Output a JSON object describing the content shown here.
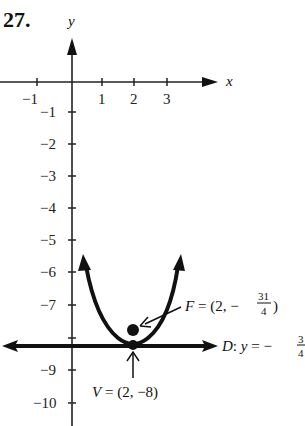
{
  "problem_number": "27.",
  "axes": {
    "x_label": "x",
    "y_label": "y",
    "x_ticks": [
      {
        "value": -1,
        "label": "−1"
      },
      {
        "value": 1,
        "label": "1"
      },
      {
        "value": 2,
        "label": "2"
      },
      {
        "value": 3,
        "label": "3"
      }
    ],
    "y_ticks": [
      {
        "value": -1,
        "label": "−1"
      },
      {
        "value": -2,
        "label": "−2"
      },
      {
        "value": -3,
        "label": "−3"
      },
      {
        "value": -4,
        "label": "−4"
      },
      {
        "value": -5,
        "label": "−5"
      },
      {
        "value": -6,
        "label": "−6"
      },
      {
        "value": -7,
        "label": "−7"
      },
      {
        "value": -9,
        "label": "−9"
      },
      {
        "value": -10,
        "label": "−10"
      }
    ]
  },
  "parabola": {
    "vertex": [
      2,
      -8
    ],
    "focus": [
      2,
      -7.75
    ],
    "directrix_y": -8.25,
    "opens": "up"
  },
  "annotations": {
    "focus_label": {
      "prefix": "F = (2, −",
      "num": "31",
      "den": "4",
      "suffix": ")"
    },
    "directrix_label": {
      "prefix": "D: y = −",
      "num": "3",
      "den": "4"
    },
    "vertex_label": "V = (2, −8)"
  }
}
